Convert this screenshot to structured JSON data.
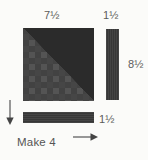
{
  "diagram": {
    "instruction": "Make 4",
    "background_color": "#fbfbf9",
    "label_color": "#5b5b5b",
    "labels": {
      "square_width": "7½",
      "strip_width": "1½",
      "strip_length": "8½",
      "bar_width": "1½"
    },
    "pieces": [
      {
        "name": "pieced-square",
        "width_label": "7½",
        "fill": "#4a4a4a",
        "accent_fill": "#2b2b2b",
        "pattern": "checkered",
        "corner": "bottom-right-triangle"
      },
      {
        "name": "vertical-strip",
        "width_label": "1½",
        "length_label": "8½",
        "fill": "#3a3a3a",
        "pattern": "striped"
      },
      {
        "name": "horizontal-bar",
        "width_label": "1½",
        "fill": "#3a3a3a",
        "pattern": "striped"
      }
    ],
    "arrows": [
      {
        "name": "down-arrow",
        "direction": "down"
      },
      {
        "name": "right-arrow",
        "direction": "right"
      }
    ]
  }
}
